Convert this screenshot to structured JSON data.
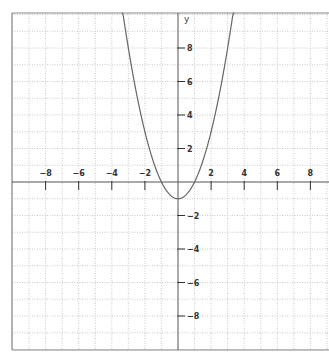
{
  "chart_data": {
    "type": "line",
    "title": "",
    "xlabel": "",
    "ylabel": "y",
    "function": "y = x^2 - 1",
    "xlim": [
      -10,
      9.3
    ],
    "ylim": [
      -10,
      10
    ],
    "grid": true,
    "grid_style": "dotted",
    "x_ticks": [
      -8,
      -6,
      -4,
      -2,
      2,
      4,
      6,
      8
    ],
    "y_ticks": [
      8,
      6,
      4,
      2,
      -2,
      -4,
      -6,
      -8
    ],
    "x_tick_labels": [
      "−8",
      "−6",
      "−4",
      "−2",
      "2",
      "4",
      "6",
      "8"
    ],
    "y_tick_labels": [
      "8",
      "6",
      "4",
      "2",
      "−2",
      "−4",
      "−6",
      "−8"
    ],
    "series": [
      {
        "name": "parabola",
        "x": [
          -3.3,
          -3,
          -2.5,
          -2,
          -1.5,
          -1,
          -0.5,
          0,
          0.5,
          1,
          1.5,
          2,
          2.5,
          3,
          3.3
        ],
        "values": [
          9.89,
          8,
          5.25,
          3,
          1.25,
          0,
          -0.75,
          -1,
          -0.75,
          0,
          1.25,
          3,
          5.25,
          8,
          9.89
        ]
      }
    ],
    "vertex": [
      0,
      -1
    ],
    "x_intercepts": [
      -1,
      1
    ]
  },
  "colors": {
    "axis": "#555555",
    "frame": "#888888",
    "grid": "#bbbbbb",
    "curve": "#666666",
    "background": "#ffffff"
  }
}
